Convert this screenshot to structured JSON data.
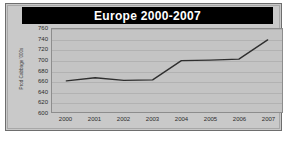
{
  "chart_data": {
    "type": "line",
    "title": "Europe 2000-2007",
    "xlabel": "",
    "ylabel": "Prod Cabbage '000s",
    "categories": [
      "2000",
      "2001",
      "2002",
      "2003",
      "2004",
      "2005",
      "2006",
      "2007"
    ],
    "values": [
      660,
      666,
      661,
      662,
      699,
      700,
      702,
      739
    ],
    "series": [
      {
        "name": "Prod Cabbage '000s",
        "values": [
          660,
          666,
          661,
          662,
          699,
          700,
          702,
          739
        ]
      }
    ],
    "ylim": [
      600,
      760
    ],
    "yticks": [
      "760",
      "740",
      "720",
      "700",
      "680",
      "660",
      "640",
      "620",
      "600"
    ],
    "ytick_values": [
      760,
      740,
      720,
      700,
      680,
      660,
      640,
      620,
      600
    ],
    "grid": true,
    "legend": false,
    "legend_position": "none",
    "colors": {
      "line": "#2f2f2f",
      "plot_background": "#c4c4c4",
      "card_background": "#c9c9c9",
      "title_background": "#000000",
      "title_text": "#ffffff",
      "gridline": "#b2b2b2",
      "axis_text": "#2b2b2b"
    }
  }
}
